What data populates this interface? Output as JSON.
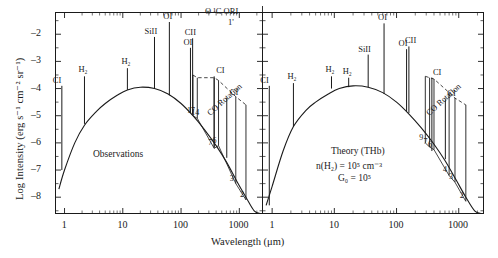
{
  "figure": {
    "axis": {
      "ylabel": "Log Intensity (erg s⁻¹ cm⁻² sr⁻¹)",
      "xlabel": "Wavelength (μm)",
      "yticks": [
        "-1",
        "-2",
        "-3",
        "-4",
        "-5",
        "-6",
        "-7",
        "-8"
      ],
      "xticks": [
        "1",
        "10",
        "100",
        "1000"
      ]
    },
    "header_annotation": {
      "source": "Θ ¹C ORI",
      "aperture": "1'"
    },
    "panels": [
      {
        "id": "observations",
        "title": "Observations",
        "subtitle_lines": [],
        "continuum_label": "CO Rotation",
        "lines": [
          {
            "label": "CI",
            "wavelength": 610,
            "type": "ion"
          },
          {
            "label": "H₂",
            "wavelength": 2.2,
            "type": "ion"
          },
          {
            "label": "H₂",
            "wavelength": 12,
            "type": "ion"
          },
          {
            "label": "SiII",
            "wavelength": 35,
            "type": "ion"
          },
          {
            "label": "OI",
            "wavelength": 63,
            "type": "ion"
          },
          {
            "label": "OI",
            "wavelength": 145,
            "type": "ion"
          },
          {
            "label": "CII",
            "wavelength": 158,
            "type": "ion"
          },
          {
            "label": "CI",
            "wavelength": 370,
            "type": "ion"
          },
          {
            "label": "CI",
            "wavelength": 609,
            "type": "ion"
          }
        ],
        "co_transitions": [
          "17",
          "14",
          "7",
          "6",
          "3",
          "2"
        ]
      },
      {
        "id": "theory",
        "title": "Theory (THb)",
        "subtitle_lines": [
          "n(H₂) = 10⁵ cm⁻³",
          "G₀ = 10⁵"
        ],
        "continuum_label": "CO Rotation",
        "lines": [
          {
            "label": "CI",
            "wavelength": 0.9,
            "type": "ion"
          },
          {
            "label": "H₂",
            "wavelength": 2.2,
            "type": "ion"
          },
          {
            "label": "H₂",
            "wavelength": 9,
            "type": "ion"
          },
          {
            "label": "H₂",
            "wavelength": 17,
            "type": "ion"
          },
          {
            "label": "SiII",
            "wavelength": 35,
            "type": "ion"
          },
          {
            "label": "OI",
            "wavelength": 63,
            "type": "ion"
          },
          {
            "label": "OI",
            "wavelength": 145,
            "type": "ion"
          },
          {
            "label": "CII",
            "wavelength": 158,
            "type": "ion"
          },
          {
            "label": "CI",
            "wavelength": 370,
            "type": "ion"
          },
          {
            "label": "CI",
            "wavelength": 609,
            "type": "ion"
          }
        ],
        "co_transitions": [
          "9",
          "7",
          "6",
          "4",
          "3",
          "2"
        ]
      }
    ]
  },
  "chart_data": {
    "type": "line",
    "title": "Θ ¹C ORI 1'",
    "xlabel": "Wavelength (μm)",
    "ylabel": "Log Intensity (erg s⁻¹ cm⁻² sr⁻¹)",
    "xscale": "log",
    "xlim": [
      0.7,
      2500
    ],
    "ylim": [
      -8.6,
      -1.2
    ],
    "grid": false,
    "legend": "none",
    "panels": [
      {
        "name": "Observations",
        "continuum": {
          "x": [
            0.8,
            1.0,
            1.5,
            2.2,
            3.5,
            5,
            8,
            12,
            20,
            35,
            60,
            100,
            160,
            250,
            400,
            600,
            900,
            1300,
            1800,
            2300
          ],
          "y": [
            -7.7,
            -7.0,
            -6.0,
            -5.35,
            -4.85,
            -4.55,
            -4.25,
            -4.05,
            -3.95,
            -4.0,
            -4.2,
            -4.55,
            -5.0,
            -5.5,
            -6.1,
            -6.7,
            -7.4,
            -8.0,
            -8.5,
            -8.8
          ]
        },
        "emission_lines": [
          {
            "label": "CI",
            "x": 0.9,
            "ytop": -3.9,
            "ybase": -7.0
          },
          {
            "label": "H₂",
            "x": 2.2,
            "ytop": -3.55,
            "ybase": -5.3
          },
          {
            "label": "H₂",
            "x": 12,
            "ytop": -3.25,
            "ybase": -4.05
          },
          {
            "label": "SiII",
            "x": 35,
            "ytop": -2.1,
            "ybase": -4.0
          },
          {
            "label": "OI",
            "x": 63,
            "ytop": -1.55,
            "ybase": -4.25
          },
          {
            "label": "OI",
            "x": 145,
            "ytop": -2.5,
            "ybase": -4.9
          },
          {
            "label": "CII",
            "x": 158,
            "ytop": -2.15,
            "ybase": -4.95
          },
          {
            "label": "CI",
            "x": 370,
            "ytop": -3.55,
            "ybase": -6.15
          },
          {
            "label": "CI",
            "x": 609,
            "ytop": -4.35,
            "ybase": -6.55
          }
        ],
        "co_ladder": [
          {
            "J": "17",
            "x": 160,
            "ytop": -3.5,
            "ybase": -5.0
          },
          {
            "J": "14",
            "x": 190,
            "ytop": -3.6,
            "ybase": -5.1
          },
          {
            "J": "7",
            "x": 370,
            "ytop": -3.6,
            "ybase": -6.2
          },
          {
            "J": "6",
            "x": 440,
            "ytop": -3.7,
            "ybase": -6.1
          },
          {
            "J": "3",
            "x": 870,
            "ytop": -4.3,
            "ybase": -7.5
          },
          {
            "J": "2",
            "x": 1300,
            "ytop": -4.6,
            "ybase": -8.1
          }
        ]
      },
      {
        "name": "Theory (THb)",
        "continuum": {
          "x": [
            0.8,
            1.0,
            1.5,
            2.2,
            3.5,
            5,
            8,
            12,
            20,
            35,
            60,
            100,
            160,
            250,
            400,
            600,
            900,
            1300,
            1800,
            2300
          ],
          "y": [
            -8.3,
            -7.6,
            -6.3,
            -5.4,
            -4.8,
            -4.5,
            -4.2,
            -4.0,
            -3.9,
            -3.95,
            -4.15,
            -4.5,
            -4.95,
            -5.45,
            -6.05,
            -6.65,
            -7.35,
            -8.0,
            -8.5,
            -8.8
          ]
        },
        "emission_lines": [
          {
            "label": "CI",
            "x": 0.9,
            "ytop": -3.9,
            "ybase": -8.3
          },
          {
            "label": "H₂",
            "x": 2.2,
            "ytop": -3.8,
            "ybase": -5.4
          },
          {
            "label": "H₂",
            "x": 9,
            "ytop": -3.55,
            "ybase": -4.0
          },
          {
            "label": "H₂",
            "x": 17,
            "ytop": -3.6,
            "ybase": -3.95
          },
          {
            "label": "SiII",
            "x": 35,
            "ytop": -2.75,
            "ybase": -3.95
          },
          {
            "label": "OI",
            "x": 63,
            "ytop": -1.6,
            "ybase": -4.2
          },
          {
            "label": "OI",
            "x": 145,
            "ytop": -2.55,
            "ybase": -4.85
          },
          {
            "label": "CII",
            "x": 158,
            "ytop": -2.45,
            "ybase": -4.9
          },
          {
            "label": "CI",
            "x": 370,
            "ytop": -3.6,
            "ybase": -6.3
          },
          {
            "label": "CI",
            "x": 609,
            "ytop": -4.4,
            "ybase": -6.6
          }
        ],
        "co_ladder": [
          {
            "J": "9",
            "x": 290,
            "ytop": -3.55,
            "ybase": -6.0
          },
          {
            "J": "7",
            "x": 340,
            "ytop": -3.6,
            "ybase": -6.15
          },
          {
            "J": "6",
            "x": 400,
            "ytop": -3.65,
            "ybase": -6.25
          },
          {
            "J": "4",
            "x": 700,
            "ytop": -4.15,
            "ybase": -7.2
          },
          {
            "J": "3",
            "x": 870,
            "ytop": -4.35,
            "ybase": -7.45
          },
          {
            "J": "2",
            "x": 1300,
            "ytop": -4.6,
            "ybase": -8.15
          }
        ]
      }
    ]
  }
}
